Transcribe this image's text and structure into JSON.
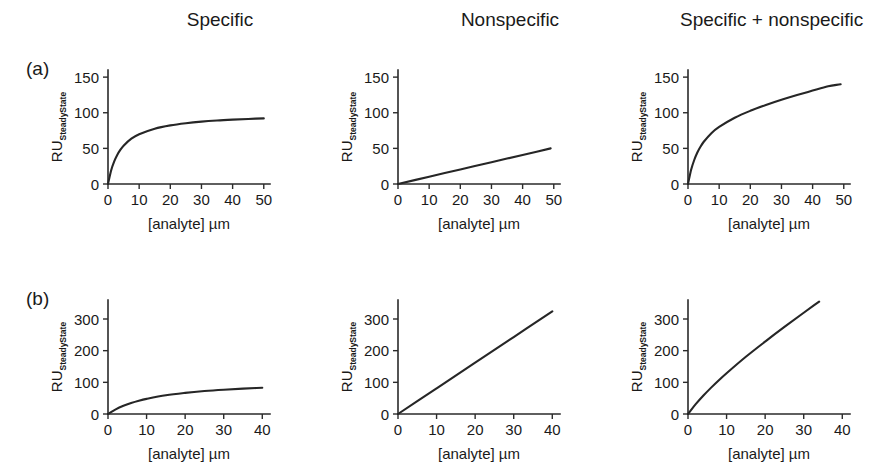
{
  "figure": {
    "panel_labels": [
      "(a)",
      "(b)"
    ],
    "column_titles": [
      "Specific",
      "Nonspecific",
      "Specific + nonspecific"
    ],
    "axis": {
      "ylabel_main": "RU",
      "ylabel_sub": "SteadyState",
      "xlabel": "[analyte] µm"
    }
  },
  "chart_data": [
    {
      "id": "a-specific",
      "type": "line",
      "title": "Specific",
      "panel": "(a)",
      "xlabel": "[analyte] µm",
      "ylabel": "RU_SteadyState",
      "xlim": [
        0,
        52
      ],
      "ylim": [
        0,
        160
      ],
      "xticks": [
        0,
        10,
        20,
        30,
        40,
        50
      ],
      "yticks": [
        0,
        50,
        100,
        150
      ],
      "grid": false,
      "legend": "none",
      "model": "langmuir",
      "params": {
        "Rmax": 100,
        "Kd": 4.3
      },
      "x": [
        0,
        1,
        2,
        3,
        4,
        5,
        7.5,
        10,
        15,
        20,
        25,
        30,
        35,
        40,
        45,
        50
      ],
      "y": [
        0,
        19,
        31.7,
        41.1,
        48.2,
        53.8,
        63.6,
        69.9,
        77.7,
        82.3,
        85.3,
        87.5,
        89.1,
        90.3,
        91.3,
        92.1
      ]
    },
    {
      "id": "a-nonspecific",
      "type": "line",
      "title": "Nonspecific",
      "panel": "(a)",
      "xlabel": "[analyte] µm",
      "ylabel": "RU_SteadyState",
      "xlim": [
        0,
        52
      ],
      "ylim": [
        0,
        160
      ],
      "xticks": [
        0,
        10,
        20,
        30,
        40,
        50
      ],
      "yticks": [
        0,
        50,
        100,
        150
      ],
      "grid": false,
      "legend": "none",
      "model": "linear",
      "params": {
        "slope": 1.02,
        "intercept": 0
      },
      "x": [
        0,
        10,
        20,
        30,
        40,
        49
      ],
      "y": [
        0,
        10.2,
        20.4,
        30.6,
        40.8,
        50
      ]
    },
    {
      "id": "a-specific-plus-nonspecific",
      "type": "line",
      "title": "Specific + nonspecific",
      "panel": "(a)",
      "xlabel": "[analyte] µm",
      "ylabel": "RU_SteadyState",
      "xlim": [
        0,
        52
      ],
      "ylim": [
        0,
        160
      ],
      "xticks": [
        0,
        10,
        20,
        30,
        40,
        50
      ],
      "yticks": [
        0,
        50,
        100,
        150
      ],
      "grid": false,
      "legend": "none",
      "model": "langmuir+linear",
      "params": {
        "Rmax": 100,
        "Kd": 4.3,
        "slope": 1.02
      },
      "x": [
        0,
        1,
        2,
        3,
        4,
        5,
        7.5,
        10,
        15,
        20,
        25,
        30,
        35,
        40,
        45,
        49
      ],
      "y": [
        0,
        20,
        33.7,
        44.2,
        52.3,
        58.9,
        71.3,
        80.1,
        93,
        102.7,
        110.8,
        118.1,
        124.8,
        131.1,
        137.2,
        140
      ]
    },
    {
      "id": "b-specific",
      "type": "line",
      "title": "Specific",
      "panel": "(b)",
      "xlabel": "[analyte] µm",
      "ylabel": "RU_SteadyState",
      "xlim": [
        0,
        42
      ],
      "ylim": [
        0,
        360
      ],
      "xticks": [
        0,
        10,
        20,
        30,
        40
      ],
      "yticks": [
        0,
        100,
        200,
        300
      ],
      "grid": false,
      "legend": "none",
      "model": "langmuir",
      "params": {
        "Rmax": 110,
        "Kd": 13
      },
      "x": [
        0,
        2,
        4,
        6,
        8,
        10,
        15,
        20,
        25,
        30,
        35,
        40
      ],
      "y": [
        0,
        14.7,
        25.9,
        34.7,
        41.9,
        47.8,
        59.2,
        66.7,
        72.4,
        76.7,
        80.2,
        83
      ]
    },
    {
      "id": "b-nonspecific",
      "type": "line",
      "title": "Nonspecific",
      "panel": "(b)",
      "xlabel": "[analyte] µm",
      "ylabel": "RU_SteadyState",
      "xlim": [
        0,
        42
      ],
      "ylim": [
        0,
        360
      ],
      "xticks": [
        0,
        10,
        20,
        30,
        40
      ],
      "yticks": [
        0,
        100,
        200,
        300
      ],
      "grid": false,
      "legend": "none",
      "model": "linear",
      "params": {
        "slope": 8.1,
        "intercept": 0
      },
      "x": [
        0,
        10,
        20,
        30,
        40
      ],
      "y": [
        0,
        81,
        162,
        243,
        324
      ]
    },
    {
      "id": "b-specific-plus-nonspecific",
      "type": "line",
      "title": "Specific + nonspecific",
      "panel": "(b)",
      "xlabel": "[analyte] µm",
      "ylabel": "RU_SteadyState",
      "xlim": [
        0,
        42
      ],
      "ylim": [
        0,
        360
      ],
      "xticks": [
        0,
        10,
        20,
        30,
        40
      ],
      "yticks": [
        0,
        100,
        200,
        300
      ],
      "grid": false,
      "legend": "none",
      "model": "langmuir+linear",
      "params": {
        "Rmax": 110,
        "Kd": 13,
        "slope": 8.1
      },
      "x": [
        0,
        2,
        4,
        6,
        8,
        10,
        15,
        20,
        25,
        30,
        34
      ],
      "y": [
        0,
        31,
        58.3,
        83.3,
        106.7,
        128.8,
        180.7,
        228.7,
        274.9,
        319.7,
        355
      ]
    }
  ]
}
